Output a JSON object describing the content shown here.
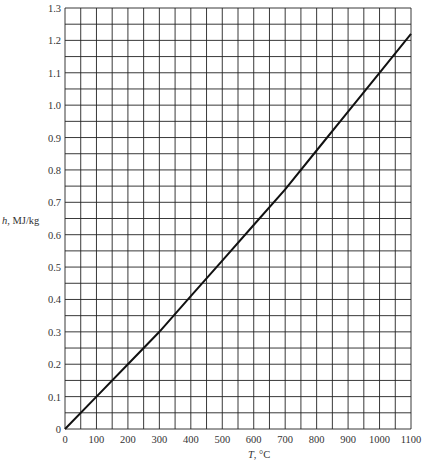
{
  "chart_data": {
    "type": "line",
    "title": "",
    "xlabel_var": "T",
    "xlabel_unit": ", °C",
    "ylabel_var": "h",
    "ylabel_unit": ", MJ/kg",
    "xlim": [
      0,
      1100
    ],
    "ylim": [
      0,
      1.3
    ],
    "grid": true,
    "x_minor_step": 50,
    "y_minor_step": 0.05,
    "x_ticks": [
      0,
      100,
      200,
      300,
      400,
      500,
      600,
      700,
      800,
      900,
      1000,
      1100
    ],
    "x_tick_labels": [
      "0",
      "100",
      "200",
      "300",
      "400",
      "500",
      "600",
      "700",
      "800",
      "900",
      "1000",
      "1100"
    ],
    "y_ticks": [
      0,
      0.1,
      0.2,
      0.3,
      0.4,
      0.5,
      0.6,
      0.7,
      0.8,
      0.9,
      1.0,
      1.1,
      1.2,
      1.3
    ],
    "y_tick_labels": [
      "0",
      "0.1",
      "0.2",
      "0.3",
      "0.4",
      "0.5",
      "0.6",
      "0.7",
      "0.8",
      "0.9",
      "1.0",
      "1.1",
      "1.2",
      "1.3"
    ],
    "series": [
      {
        "name": "h(T)",
        "x": [
          0,
          100,
          200,
          300,
          400,
          500,
          600,
          700,
          800,
          900,
          1000,
          1100
        ],
        "y": [
          0,
          0.1,
          0.2,
          0.3,
          0.41,
          0.52,
          0.63,
          0.74,
          0.86,
          0.98,
          1.1,
          1.22
        ]
      }
    ]
  }
}
